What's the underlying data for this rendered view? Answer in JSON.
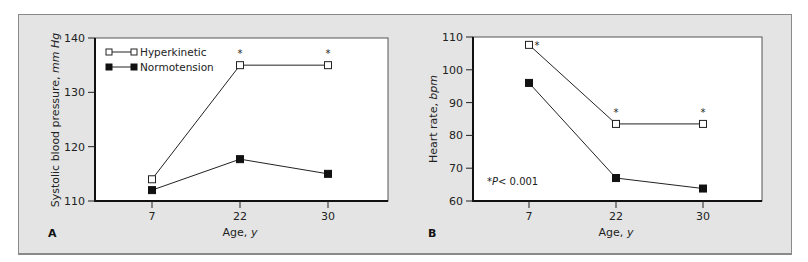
{
  "figure": {
    "background": "#e4e4e4",
    "plot_background": "#ffffff",
    "line_color": "#222222",
    "marker_filled": "#111111",
    "marker_open_fill": "#ffffff"
  },
  "panels": [
    {
      "letter": "A",
      "ylabel_main": "Systolic blood pressure, ",
      "ylabel_unit": "mm Hg",
      "xlabel_main": "Age, ",
      "xlabel_unit": "y",
      "yticks": [
        "110",
        "120",
        "130",
        "140"
      ],
      "xticks": [
        "7",
        "22",
        "30"
      ],
      "legend": [
        {
          "label": "Hyperkinetic",
          "marker": "open-square"
        },
        {
          "label": "Normotension",
          "marker": "filled-square"
        }
      ]
    },
    {
      "letter": "B",
      "ylabel_main": "Heart rate, ",
      "ylabel_unit": "bpm",
      "xlabel_main": "Age, ",
      "xlabel_unit": "y",
      "yticks": [
        "60",
        "70",
        "80",
        "90",
        "100",
        "110"
      ],
      "xticks": [
        "7",
        "22",
        "30"
      ],
      "note_star": "*",
      "note_p": "P",
      "note_rest": "< 0.001"
    }
  ],
  "chart_data": [
    {
      "type": "line",
      "panel": "A",
      "title": "",
      "xlabel": "Age, y",
      "ylabel": "Systolic blood pressure, mm Hg",
      "categories": [
        7,
        22,
        30
      ],
      "ylim": [
        110,
        140
      ],
      "yticks": [
        110,
        120,
        130,
        140
      ],
      "grid": false,
      "legend_position": "upper left",
      "series": [
        {
          "name": "Hyperkinetic",
          "marker": "open square",
          "values": [
            114,
            135,
            135
          ],
          "significant": [
            false,
            true,
            true
          ]
        },
        {
          "name": "Normotension",
          "marker": "filled square",
          "values": [
            112,
            117.7,
            115
          ]
        }
      ]
    },
    {
      "type": "line",
      "panel": "B",
      "title": "",
      "xlabel": "Age, y",
      "ylabel": "Heart rate, bpm",
      "categories": [
        7,
        22,
        30
      ],
      "ylim": [
        60,
        110
      ],
      "yticks": [
        60,
        70,
        80,
        90,
        100,
        110
      ],
      "grid": false,
      "annotation": "*P<0.001",
      "series": [
        {
          "name": "Hyperkinetic",
          "marker": "open square",
          "values": [
            107.6,
            83.5,
            83.5
          ],
          "significant": [
            true,
            true,
            true
          ]
        },
        {
          "name": "Normotension",
          "marker": "filled square",
          "values": [
            96,
            67,
            63.8
          ]
        }
      ]
    }
  ]
}
